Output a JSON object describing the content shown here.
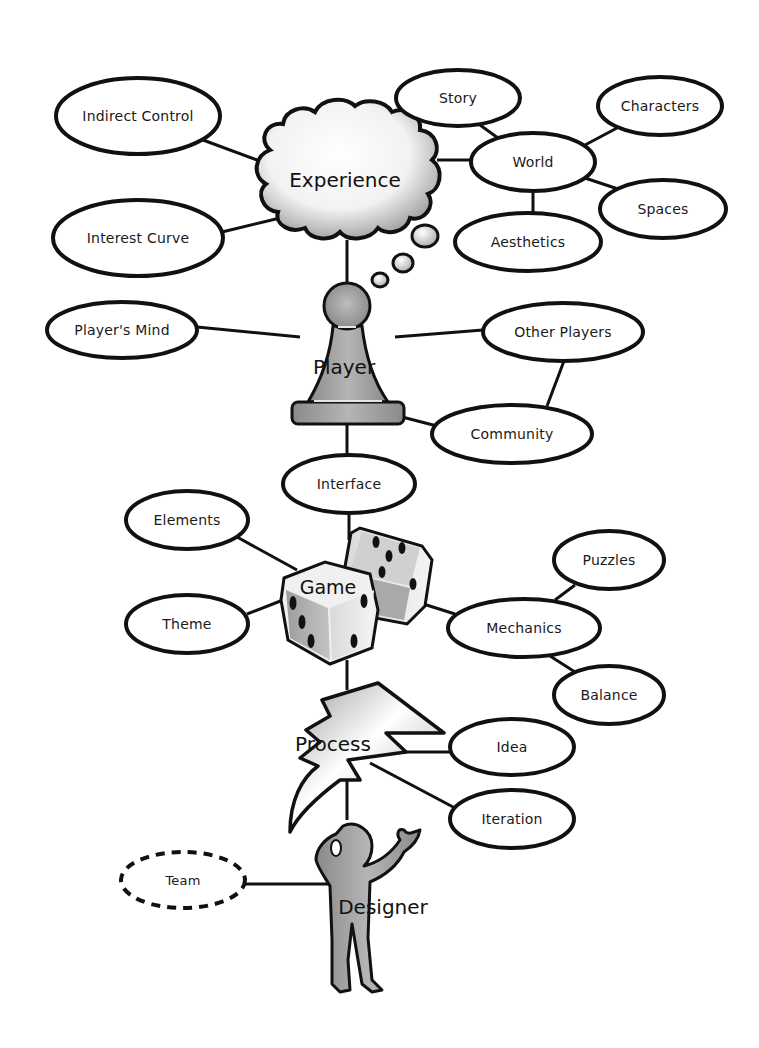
{
  "diagram": {
    "hubs": {
      "experience": {
        "label": "Experience",
        "shape": "cloud-icon",
        "x": 345,
        "y": 180
      },
      "player": {
        "label": "Player",
        "shape": "pawn-icon",
        "x": 347,
        "y": 368
      },
      "game": {
        "label": "Game",
        "shape": "dice-icon",
        "x": 340,
        "y": 590
      },
      "process": {
        "label": "Process",
        "shape": "lightning-bolt-icon",
        "x": 335,
        "y": 745
      },
      "designer": {
        "label": "Designer",
        "shape": "person-icon",
        "x": 383,
        "y": 908
      }
    },
    "nodes": {
      "indirect_control": {
        "label": "Indirect Control",
        "x": 138,
        "y": 116,
        "rx": 82,
        "ry": 38
      },
      "interest_curve": {
        "label": "Interest Curve",
        "x": 138,
        "y": 238,
        "rx": 85,
        "ry": 38
      },
      "story": {
        "label": "Story",
        "x": 458,
        "y": 98,
        "rx": 62,
        "ry": 28
      },
      "world": {
        "label": "World",
        "x": 533,
        "y": 162,
        "rx": 62,
        "ry": 29
      },
      "characters": {
        "label": "Characters",
        "x": 660,
        "y": 106,
        "rx": 62,
        "ry": 29
      },
      "spaces": {
        "label": "Spaces",
        "x": 663,
        "y": 209,
        "rx": 63,
        "ry": 29
      },
      "aesthetics": {
        "label": "Aesthetics",
        "x": 528,
        "y": 242,
        "rx": 73,
        "ry": 29
      },
      "players_mind": {
        "label": "Player's Mind",
        "x": 122,
        "y": 330,
        "rx": 75,
        "ry": 28
      },
      "other_players": {
        "label": "Other Players",
        "x": 563,
        "y": 332,
        "rx": 80,
        "ry": 29
      },
      "community": {
        "label": "Community",
        "x": 512,
        "y": 434,
        "rx": 80,
        "ry": 29
      },
      "interface": {
        "label": "Interface",
        "x": 349,
        "y": 484,
        "rx": 66,
        "ry": 29
      },
      "elements": {
        "label": "Elements",
        "x": 187,
        "y": 520,
        "rx": 61,
        "ry": 29
      },
      "theme": {
        "label": "Theme",
        "x": 187,
        "y": 624,
        "rx": 61,
        "ry": 29
      },
      "puzzles": {
        "label": "Puzzles",
        "x": 609,
        "y": 560,
        "rx": 55,
        "ry": 29
      },
      "mechanics": {
        "label": "Mechanics",
        "x": 524,
        "y": 628,
        "rx": 76,
        "ry": 29
      },
      "balance": {
        "label": "Balance",
        "x": 609,
        "y": 695,
        "rx": 55,
        "ry": 29
      },
      "idea": {
        "label": "Idea",
        "x": 512,
        "y": 747,
        "rx": 62,
        "ry": 28
      },
      "iteration": {
        "label": "Iteration",
        "x": 512,
        "y": 819,
        "rx": 62,
        "ry": 29
      },
      "team": {
        "label": "Team",
        "x": 183,
        "y": 880,
        "rx": 62,
        "ry": 28,
        "dashed": true
      }
    },
    "colors": {
      "outline": "#111111",
      "fill": "#ffffff",
      "figure_gray": "#8c8c8c",
      "figure_light": "#c8c8c8"
    }
  }
}
